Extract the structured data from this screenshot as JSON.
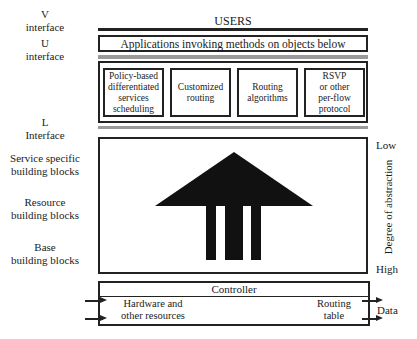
{
  "left_labels": {
    "v_interface": "V\ninterface",
    "u_interface": "U\ninterface",
    "l_interface": "L\nInterface",
    "service_specific": "Service specific\nbuilding blocks",
    "resource": "Resource\nbuilding blocks",
    "base": "Base\nbuilding blocks"
  },
  "top": {
    "users": "USERS",
    "applications": "Applications invoking methods on objects below"
  },
  "services": [
    {
      "label": "Policy-based\ndifferentiated\nservices\nscheduling"
    },
    {
      "label": "Customized\nrouting"
    },
    {
      "label": "Routing\nalgorithms"
    },
    {
      "label": "RSVP\nor other\nper-flow\nprotocol"
    }
  ],
  "abstraction": {
    "low": "Low",
    "axis_label": "Degree of abstraction",
    "high": "High"
  },
  "controller": {
    "title": "Controller",
    "left_text": "Hardware and\nother resources",
    "right_text": "Routing\ntable",
    "data_label": "Data"
  },
  "colors": {
    "line": "#222222",
    "rail_gray": "#9a9a9a",
    "background": "#ffffff"
  }
}
